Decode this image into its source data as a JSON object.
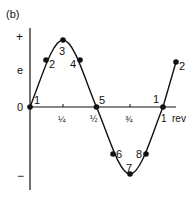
{
  "panel_label": "(b)",
  "axes": {
    "y_label": "e",
    "y_plus": "+",
    "y_minus": "−",
    "origin_label": "0",
    "x_ticks": [
      "¼",
      "½",
      "¾",
      "1"
    ],
    "x_unit": "rev"
  },
  "points": [
    {
      "label": "1",
      "phase": 0
    },
    {
      "label": "2",
      "phase": 0.125
    },
    {
      "label": "3",
      "phase": 0.25
    },
    {
      "label": "4",
      "phase": 0.375
    },
    {
      "label": "5",
      "phase": 0.5
    },
    {
      "label": "6",
      "phase": 0.625
    },
    {
      "label": "7",
      "phase": 0.75
    },
    {
      "label": "8",
      "phase": 0.875
    },
    {
      "label": "1",
      "phase": 1.0
    },
    {
      "label": "2",
      "phase": 1.125
    }
  ],
  "colors": {
    "ink": "#111111",
    "background": "#ffffff"
  }
}
